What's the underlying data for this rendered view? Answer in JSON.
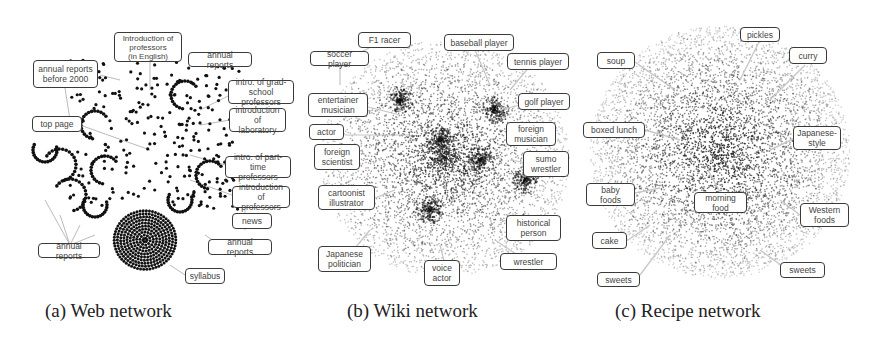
{
  "figure": {
    "panels": [
      {
        "id": "a",
        "caption": "(a) Web network",
        "labels": [
          "Introduction of\nprofessors\n(in English)",
          "annual reports\nbefore 2000",
          "annual reports",
          "intro. of grad-\nschool professors",
          "introduction\nof laboratory",
          "top page",
          "intro. of part-\ntime professors",
          "introduction\nof professors",
          "news",
          "annual reports",
          "annual reports",
          "syllabus"
        ]
      },
      {
        "id": "b",
        "caption": "(b) Wiki network",
        "labels": [
          "F1 racer",
          "baseball player",
          "soccer player",
          "tennis player",
          "entertainer\nmusician",
          "golf player",
          "actor",
          "foreign\nmusician",
          "foreign\nscientist",
          "sumo\nwrestler",
          "cartoonist\nillustrator",
          "historical\nperson",
          "Japanese\npolitician",
          "voice\nactor",
          "wrestler"
        ]
      },
      {
        "id": "c",
        "caption": "(c) Recipe network",
        "labels": [
          "pickles",
          "soup",
          "curry",
          "boxed lunch",
          "Japanese-\nstyle",
          "baby\nfoods",
          "morning\nfood",
          "Western\nfoods",
          "cake",
          "sweets",
          "sweets"
        ]
      }
    ]
  },
  "colors": {
    "node": "#111111",
    "edge": "#bbbbbb",
    "label_border": "#3a3a3a"
  }
}
